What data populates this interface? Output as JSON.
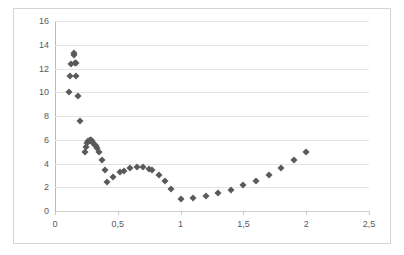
{
  "chart_data": {
    "type": "scatter",
    "title": "",
    "xlabel": "",
    "ylabel": "",
    "xlim": [
      0,
      2.5
    ],
    "ylim": [
      0,
      16
    ],
    "grid": true,
    "legend": "none",
    "marker": "diamond",
    "marker_color": "#5a5a5a",
    "decimal_separator": ",",
    "x_ticks": [
      0,
      0.5,
      1,
      1.5,
      2,
      2.5
    ],
    "x_tick_labels": [
      "0",
      "0,5",
      "1",
      "1,5",
      "2",
      "2,5"
    ],
    "y_ticks": [
      0,
      2,
      4,
      6,
      8,
      10,
      12,
      14,
      16
    ],
    "y_tick_labels": [
      "0",
      "2",
      "4",
      "6",
      "8",
      "10",
      "12",
      "14",
      "16"
    ],
    "series": [
      {
        "name": "series-1",
        "points": [
          [
            0.11,
            10.0
          ],
          [
            0.12,
            11.35
          ],
          [
            0.13,
            12.4
          ],
          [
            0.15,
            13.3
          ],
          [
            0.155,
            13.1
          ],
          [
            0.16,
            12.5
          ],
          [
            0.165,
            12.45
          ],
          [
            0.17,
            11.35
          ],
          [
            0.18,
            9.7
          ],
          [
            0.2,
            7.55
          ],
          [
            0.235,
            5.0
          ],
          [
            0.245,
            5.4
          ],
          [
            0.255,
            5.7
          ],
          [
            0.265,
            5.9
          ],
          [
            0.275,
            6.0
          ],
          [
            0.285,
            6.0
          ],
          [
            0.295,
            5.9
          ],
          [
            0.305,
            5.75
          ],
          [
            0.315,
            5.6
          ],
          [
            0.325,
            5.45
          ],
          [
            0.335,
            5.3
          ],
          [
            0.35,
            5.0
          ],
          [
            0.375,
            4.3
          ],
          [
            0.4,
            3.45
          ],
          [
            0.415,
            2.45
          ],
          [
            0.465,
            2.9
          ],
          [
            0.515,
            3.3
          ],
          [
            0.55,
            3.35
          ],
          [
            0.6,
            3.6
          ],
          [
            0.65,
            3.7
          ],
          [
            0.7,
            3.7
          ],
          [
            0.745,
            3.5
          ],
          [
            0.775,
            3.45
          ],
          [
            0.825,
            3.05
          ],
          [
            0.875,
            2.5
          ],
          [
            0.925,
            1.85
          ],
          [
            1.0,
            1.0
          ],
          [
            1.1,
            1.1
          ],
          [
            1.2,
            1.3
          ],
          [
            1.3,
            1.5
          ],
          [
            1.4,
            1.8
          ],
          [
            1.5,
            2.15
          ],
          [
            1.6,
            2.55
          ],
          [
            1.7,
            3.05
          ],
          [
            1.8,
            3.6
          ],
          [
            1.9,
            4.3
          ],
          [
            2.0,
            5.0
          ]
        ]
      }
    ]
  }
}
